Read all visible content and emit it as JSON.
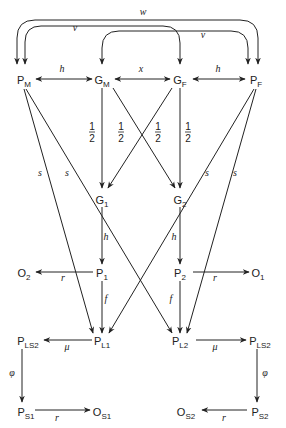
{
  "diagram": {
    "title": "",
    "nodes": [
      {
        "id": "PM",
        "base": "P",
        "sub": "M",
        "x": 24,
        "y": 80
      },
      {
        "id": "GM",
        "base": "G",
        "sub": "M",
        "x": 102,
        "y": 80
      },
      {
        "id": "GF",
        "base": "G",
        "sub": "F",
        "x": 180,
        "y": 80
      },
      {
        "id": "PF",
        "base": "P",
        "sub": "F",
        "x": 256,
        "y": 80
      },
      {
        "id": "G1",
        "base": "G",
        "sub": "1",
        "x": 102,
        "y": 200
      },
      {
        "id": "G2",
        "base": "G",
        "sub": "2",
        "x": 180,
        "y": 200
      },
      {
        "id": "O2",
        "base": "O",
        "sub": "2",
        "x": 24,
        "y": 273
      },
      {
        "id": "P1",
        "base": "P",
        "sub": "1",
        "x": 102,
        "y": 273
      },
      {
        "id": "P2",
        "base": "P",
        "sub": "2",
        "x": 180,
        "y": 273
      },
      {
        "id": "O1",
        "base": "O",
        "sub": "1",
        "x": 258,
        "y": 273
      },
      {
        "id": "PLS2a",
        "base": "P",
        "sub": "LS2",
        "x": 28,
        "y": 341
      },
      {
        "id": "PL1",
        "base": "P",
        "sub": "L1",
        "x": 102,
        "y": 341
      },
      {
        "id": "PL2",
        "base": "P",
        "sub": "L2",
        "x": 180,
        "y": 341
      },
      {
        "id": "PLS2b",
        "base": "P",
        "sub": "LS2",
        "x": 260,
        "y": 341
      },
      {
        "id": "PS1",
        "base": "P",
        "sub": "S1",
        "x": 26,
        "y": 412
      },
      {
        "id": "OS1",
        "base": "O",
        "sub": "S1",
        "x": 102,
        "y": 412
      },
      {
        "id": "OS2",
        "base": "O",
        "sub": "S2",
        "x": 186,
        "y": 412
      },
      {
        "id": "PS2",
        "base": "P",
        "sub": "S2",
        "x": 260,
        "y": 412
      }
    ],
    "edges": [
      {
        "id": "w-arc",
        "label": "w",
        "from": "PF",
        "to": "PM",
        "kind": "arc-both",
        "label_x": 143,
        "label_y": 15
      },
      {
        "id": "v-arc-left",
        "label": "v",
        "from": "PM",
        "to": "GF",
        "kind": "arc-both",
        "label_x": 75,
        "label_y": 31
      },
      {
        "id": "v-arc-right",
        "label": "v",
        "from": "GM",
        "to": "PF",
        "kind": "arc-both",
        "label_x": 203,
        "label_y": 38
      },
      {
        "id": "PM-GM",
        "label": "h",
        "kind": "double",
        "label_x": 62,
        "label_y": 72
      },
      {
        "id": "GM-GF",
        "label": "x",
        "kind": "double",
        "label_x": 141,
        "label_y": 72
      },
      {
        "id": "GF-PF",
        "label": "h",
        "kind": "double",
        "label_x": 218,
        "label_y": 72
      },
      {
        "id": "GM-G1",
        "label": "1/2",
        "kind": "arrow",
        "label_x": 92,
        "label_y": 132
      },
      {
        "id": "GM-G2",
        "label": "1/2",
        "kind": "arrow",
        "label_x": 121,
        "label_y": 132
      },
      {
        "id": "GF-G1",
        "label": "1/2",
        "kind": "arrow",
        "label_x": 158,
        "label_y": 132
      },
      {
        "id": "GF-G2",
        "label": "1/2",
        "kind": "arrow",
        "label_x": 188,
        "label_y": 132
      },
      {
        "id": "PM-PL1",
        "label": "s",
        "kind": "arrow",
        "label_x": 40,
        "label_y": 176
      },
      {
        "id": "PM-PL2",
        "label": "s",
        "kind": "arrow",
        "label_x": 67,
        "label_y": 176
      },
      {
        "id": "PF-PL1",
        "label": "s",
        "kind": "arrow",
        "label_x": 207,
        "label_y": 176
      },
      {
        "id": "PF-PL2",
        "label": "s",
        "kind": "arrow",
        "label_x": 235,
        "label_y": 176
      },
      {
        "id": "G1-P1",
        "label": "h",
        "kind": "arrow",
        "label_x": 106,
        "label_y": 240
      },
      {
        "id": "G2-P2",
        "label": "h",
        "kind": "arrow",
        "label_x": 174,
        "label_y": 240
      },
      {
        "id": "P1-O2",
        "label": "r",
        "kind": "arrow",
        "label_x": 63,
        "label_y": 281
      },
      {
        "id": "P2-O1",
        "label": "r",
        "kind": "arrow",
        "label_x": 215,
        "label_y": 281
      },
      {
        "id": "P1-PL1",
        "label": "f",
        "kind": "arrow",
        "label_x": 106,
        "label_y": 302
      },
      {
        "id": "P2-PL2",
        "label": "f",
        "kind": "arrow",
        "label_x": 171,
        "label_y": 302
      },
      {
        "id": "PL1-PLS2a",
        "label": "μ",
        "kind": "arrow",
        "label_x": 67,
        "label_y": 350
      },
      {
        "id": "PL2-PLS2b",
        "label": "μ",
        "kind": "arrow",
        "label_x": 215,
        "label_y": 350
      },
      {
        "id": "PLS2a-PS1",
        "label": "φ",
        "kind": "arrow",
        "label_x": 12,
        "label_y": 376
      },
      {
        "id": "PLS2b-PS2",
        "label": "φ",
        "kind": "arrow",
        "label_x": 265,
        "label_y": 376
      },
      {
        "id": "PS1-OS1",
        "label": "r",
        "kind": "arrow",
        "label_x": 57,
        "label_y": 421
      },
      {
        "id": "PS2-OS2",
        "label": "r",
        "kind": "arrow",
        "label_x": 224,
        "label_y": 421
      }
    ],
    "fraction": {
      "num": "1",
      "den": "2"
    }
  }
}
